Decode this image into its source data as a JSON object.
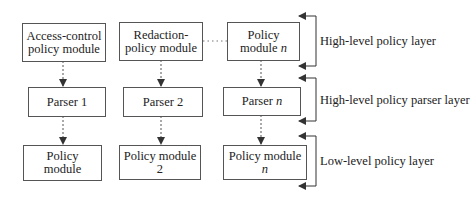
{
  "diagram": {
    "columns": [
      {
        "high_level_module": [
          "Access-control",
          "policy module"
        ],
        "parser": "Parser 1",
        "low_level_module": [
          "Policy",
          "module"
        ]
      },
      {
        "high_level_module": [
          "Redaction-",
          "policy module"
        ],
        "parser": "Parser 2",
        "low_level_module": [
          "Policy module",
          "2"
        ]
      },
      {
        "high_level_module": [
          "Policy",
          "module n"
        ],
        "parser": "Parser n",
        "low_level_module": [
          "Policy module",
          "n"
        ]
      }
    ],
    "layers": [
      "High-level policy layer",
      "High-level policy parser layer",
      "Low-level policy layer"
    ]
  }
}
